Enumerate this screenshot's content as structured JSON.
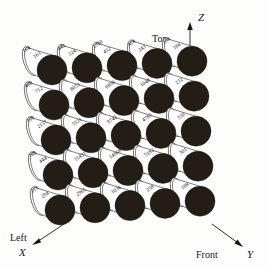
{
  "figure": {
    "axes": [
      {
        "name": "z-axis",
        "label": "Z",
        "side_label": "Top",
        "direction": "up"
      },
      {
        "name": "x-axis",
        "label": "X",
        "side_label": "Left",
        "direction": "down-left"
      },
      {
        "name": "y-axis",
        "label": "Y",
        "side_label": "Front",
        "direction": "down-right"
      }
    ],
    "grid": {
      "rows": 5,
      "cols": 5
    },
    "colors": {
      "disc": "#231d16",
      "outline": "#2a2a2a",
      "background": "#fdfdfc",
      "text": "#111111"
    },
    "rows": [
      {
        "row_index": 0,
        "front_values": [
          "163",
          "324",
          "432",
          "243",
          "166"
        ],
        "back_values": [
          "164",
          "442",
          "1320",
          "414",
          "188"
        ]
      },
      {
        "row_index": 1,
        "front_values": [
          "712",
          "8053",
          "6898",
          "1048",
          "232"
        ],
        "back_values": [
          "480",
          "",
          "",
          "",
          ""
        ]
      },
      {
        "row_index": 2,
        "front_values": [
          "2137",
          "5531",
          "9742",
          "4785",
          "330"
        ],
        "back_values": [
          "599",
          "",
          "",
          "",
          ""
        ]
      },
      {
        "row_index": 3,
        "front_values": [
          "444",
          "11431",
          "14968",
          "5182",
          "301"
        ],
        "back_values": [
          "789",
          "",
          "",
          "",
          ""
        ]
      },
      {
        "row_index": 4,
        "front_values": [
          "294",
          "2961",
          "1036",
          "258",
          "188"
        ],
        "back_values": [
          "213",
          "",
          "",
          "",
          ""
        ]
      }
    ]
  }
}
